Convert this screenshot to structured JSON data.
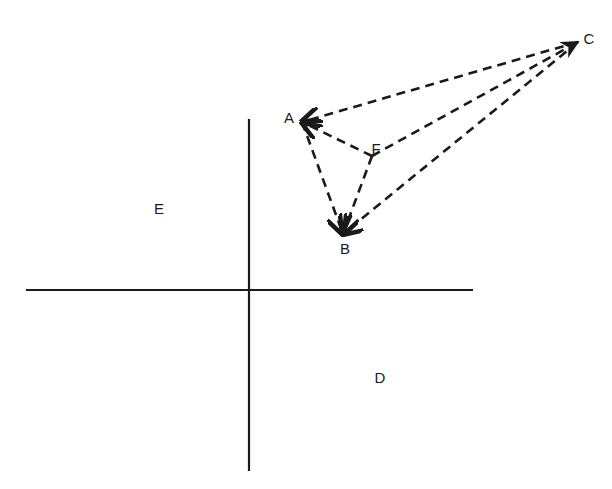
{
  "diagram": {
    "type": "vector diagram on quadrant axes",
    "colors": {
      "ink": "#1a1a1a",
      "background": "#ffffff"
    },
    "axes": {
      "vertical": {
        "x": 249,
        "y1": 119,
        "y2": 471
      },
      "horizontal": {
        "y": 290,
        "x1": 26,
        "x2": 473
      }
    },
    "region_labels": [
      {
        "id": "E",
        "text": "E",
        "x": 159,
        "y": 208
      },
      {
        "id": "D",
        "text": "D",
        "x": 380,
        "y": 377
      }
    ],
    "points": [
      {
        "id": "A",
        "text": "A",
        "x": 302,
        "y": 122,
        "label_x": 289,
        "label_y": 117
      },
      {
        "id": "F",
        "text": "F",
        "x": 372,
        "y": 156,
        "label_x": 376,
        "label_y": 148
      },
      {
        "id": "B",
        "text": "B",
        "x": 343,
        "y": 234,
        "label_x": 345,
        "label_y": 248
      },
      {
        "id": "C",
        "text": "C",
        "x": 578,
        "y": 42,
        "label_x": 589,
        "label_y": 38
      }
    ],
    "edges": [
      {
        "from": "C",
        "to": "A",
        "style": "dashed",
        "arrow_at": "A"
      },
      {
        "from": "F",
        "to": "A",
        "style": "dashed",
        "arrow_at": "A"
      },
      {
        "from": "A",
        "to": "B",
        "style": "dashed",
        "arrow_at": "B"
      },
      {
        "from": "F",
        "to": "B",
        "style": "dashed",
        "arrow_at": "B"
      },
      {
        "from": "C",
        "to": "B",
        "style": "dashed",
        "arrow_at": "B"
      },
      {
        "from": "F",
        "to": "C",
        "style": "dashed",
        "arrow_at": "C"
      }
    ]
  }
}
